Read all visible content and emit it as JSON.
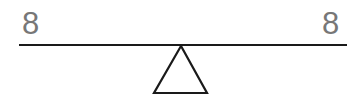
{
  "diagram": {
    "type": "seesaw-balance",
    "left_side": {
      "label": "8"
    },
    "right_side": {
      "label": "8"
    },
    "state": "balanced"
  },
  "colors": {
    "label": "#777777",
    "beam": "#1a1a1a",
    "fulcrum": "#1a1a1a",
    "background": "#ffffff"
  }
}
